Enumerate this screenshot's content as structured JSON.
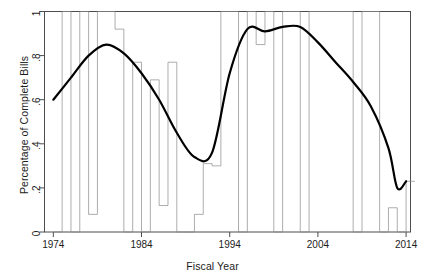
{
  "chart_data": {
    "type": "line",
    "title": "",
    "subtitle": "",
    "xlabel": "Fiscal Year",
    "ylabel": "Percentage of Complete Bills",
    "xlim": [
      1973,
      2014.5
    ],
    "ylim": [
      0,
      1
    ],
    "grid": false,
    "legend": null,
    "x_tick_labels": [
      "1974",
      "1984",
      "1994",
      "2004",
      "2014"
    ],
    "x_tick_values": [
      1974,
      1984,
      1994,
      2004,
      2014
    ],
    "y_tick_labels": [
      "0",
      ".2",
      ".4",
      ".6",
      ".8",
      "1"
    ],
    "y_tick_values": [
      0,
      0.2,
      0.4,
      0.6,
      0.8,
      1
    ],
    "series": [
      {
        "name": "Percentage of complete bills (annual)",
        "style": "step",
        "color": "#8a8a8a",
        "linewidth": 0.7,
        "x": [
          1974,
          1975,
          1976,
          1977,
          1978,
          1979,
          1980,
          1981,
          1982,
          1983,
          1984,
          1985,
          1986,
          1987,
          1988,
          1989,
          1990,
          1991,
          1992,
          1993,
          1994,
          1995,
          1996,
          1997,
          1998,
          1999,
          2000,
          2001,
          2002,
          2003,
          2004,
          2005,
          2006,
          2007,
          2008,
          2009,
          2010,
          2011,
          2012,
          2013,
          2014
        ],
        "values": [
          0.0,
          1.0,
          0.0,
          1.0,
          0.08,
          1.0,
          1.0,
          0.92,
          0.0,
          0.77,
          0.0,
          0.69,
          0.12,
          0.77,
          0.0,
          0.0,
          0.08,
          0.31,
          0.3,
          1.0,
          1.0,
          0.0,
          1.0,
          0.85,
          1.0,
          0.0,
          1.0,
          1.0,
          0.0,
          1.0,
          1.0,
          1.0,
          1.0,
          1.0,
          0.0,
          1.0,
          1.0,
          0.0,
          0.11,
          0.0,
          0.23
        ]
      },
      {
        "name": "LOESS smooth",
        "style": "smooth",
        "color": "#000000",
        "linewidth": 2.2,
        "x": [
          1974,
          1976,
          1978,
          1980,
          1982,
          1984,
          1986,
          1988,
          1990,
          1992,
          1994,
          1996,
          1998,
          2000,
          2002,
          2004,
          2006,
          2008,
          2010,
          2012,
          2013,
          2014
        ],
        "values": [
          0.6,
          0.7,
          0.8,
          0.85,
          0.81,
          0.72,
          0.6,
          0.45,
          0.34,
          0.36,
          0.72,
          0.92,
          0.91,
          0.93,
          0.93,
          0.86,
          0.77,
          0.68,
          0.57,
          0.38,
          0.2,
          0.23
        ]
      }
    ]
  },
  "axes": {
    "x_title": "Fiscal Year",
    "y_title": "Percentage of Complete Bills"
  },
  "colors": {
    "series_gray": "#8a8a8a",
    "smooth_black": "#000000",
    "frame": "#4d4d4d",
    "background": "#ffffff",
    "text": "#1c1c1c"
  }
}
